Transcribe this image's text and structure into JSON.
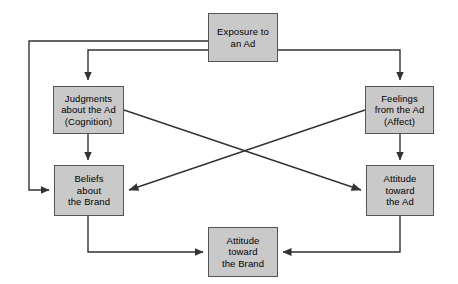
{
  "diagram": {
    "colors": {
      "node_fill": "#c9c9c9",
      "node_border": "#555555",
      "edge": "#333333",
      "text": "#000000",
      "background": "#ffffff"
    },
    "nodes": [
      {
        "id": "exposure",
        "name": "exposure-to-an-ad",
        "lines": [
          "Exposure to",
          "an Ad"
        ],
        "x": 208,
        "y": 13,
        "w": 70,
        "h": 49
      },
      {
        "id": "judgments",
        "name": "judgments-about-the-ad",
        "lines": [
          "Judgments",
          "about the Ad",
          "(Cognition)"
        ],
        "x": 53,
        "y": 86,
        "w": 71,
        "h": 48
      },
      {
        "id": "feelings",
        "name": "feelings-from-the-ad",
        "lines": [
          "Feelings",
          "from the Ad",
          "(Affect)"
        ],
        "x": 365,
        "y": 86,
        "w": 69,
        "h": 48
      },
      {
        "id": "beliefs",
        "name": "beliefs-about-the-brand",
        "lines": [
          "Beliefs",
          "about",
          "the Brand"
        ],
        "x": 54,
        "y": 165,
        "w": 70,
        "h": 51
      },
      {
        "id": "attitude_ad",
        "name": "attitude-toward-the-ad",
        "lines": [
          "Attitude",
          "toward",
          "the Ad"
        ],
        "x": 366,
        "y": 165,
        "w": 68,
        "h": 51
      },
      {
        "id": "attitude_brand",
        "name": "attitude-toward-the-brand",
        "lines": [
          "Attitude",
          "toward",
          "the Brand"
        ],
        "x": 208,
        "y": 227,
        "w": 70,
        "h": 50
      }
    ],
    "edges": [
      {
        "id": "e1",
        "name": "edge-exposure-to-judgments",
        "from": "exposure",
        "to": "judgments",
        "points": "208,50 88,50 88,82",
        "arrow": "down"
      },
      {
        "id": "e2",
        "name": "edge-exposure-to-feelings",
        "from": "exposure",
        "to": "feelings",
        "points": "278,50 400,50 400,82",
        "arrow": "down"
      },
      {
        "id": "e3",
        "name": "edge-exposure-to-beliefs",
        "from": "exposure",
        "to": "beliefs",
        "points": "208,41 29,41 29,190 50,190",
        "arrow": "right"
      },
      {
        "id": "e4",
        "name": "edge-judgments-to-beliefs",
        "from": "judgments",
        "to": "beliefs",
        "points": "88,134 88,161",
        "arrow": "down"
      },
      {
        "id": "e5",
        "name": "edge-feelings-to-attitude-ad",
        "from": "feelings",
        "to": "attitude_ad",
        "points": "400,134 400,161",
        "arrow": "down"
      },
      {
        "id": "e6",
        "name": "edge-judgments-to-attitude-ad",
        "from": "judgments",
        "to": "attitude_ad",
        "points": "124,110 362,190",
        "arrow": "diagonal-down-right"
      },
      {
        "id": "e7",
        "name": "edge-feelings-to-beliefs",
        "from": "feelings",
        "to": "beliefs",
        "points": "365,110 128,190",
        "arrow": "diagonal-down-left"
      },
      {
        "id": "e8",
        "name": "edge-beliefs-to-attitude-brand",
        "from": "beliefs",
        "to": "attitude_brand",
        "points": "88,216 88,252 204,252",
        "arrow": "right"
      },
      {
        "id": "e9",
        "name": "edge-attitude-ad-to-attitude-brand",
        "from": "attitude_ad",
        "to": "attitude_brand",
        "points": "400,216 400,252 282,252",
        "arrow": "left"
      }
    ]
  }
}
